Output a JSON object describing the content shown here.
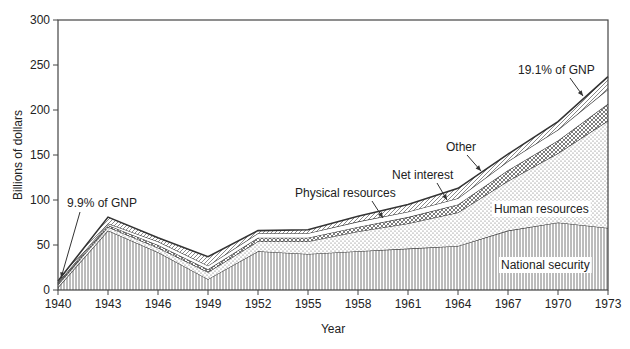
{
  "chart_data": {
    "type": "area",
    "stacked": true,
    "title": "",
    "xlabel": "Year",
    "ylabel": "Billions of dollars",
    "ylim": [
      0,
      300
    ],
    "yticks": [
      0,
      50,
      100,
      150,
      200,
      250,
      300
    ],
    "xticks": [
      1940,
      1943,
      1946,
      1949,
      1952,
      1955,
      1958,
      1961,
      1964,
      1967,
      1970,
      1973
    ],
    "x": [
      1940,
      1943,
      1946,
      1949,
      1952,
      1955,
      1958,
      1961,
      1964,
      1967,
      1970,
      1973
    ],
    "grid": false,
    "series": [
      {
        "name": "National security",
        "pattern": "vertical-lines",
        "values": [
          3,
          66,
          42,
          12,
          43,
          40,
          43,
          46,
          49,
          66,
          75,
          69
        ]
      },
      {
        "name": "Human resources",
        "pattern": "dots",
        "values": [
          3,
          4,
          5,
          8,
          11,
          14,
          22,
          28,
          37,
          55,
          77,
          119
        ]
      },
      {
        "name": "Physical resources",
        "pattern": "crosshatch",
        "values": [
          1,
          2,
          3,
          3,
          4,
          4,
          5,
          7,
          9,
          12,
          14,
          19
        ]
      },
      {
        "name": "Net interest",
        "pattern": "white",
        "values": [
          1,
          2,
          4,
          4,
          5,
          5,
          6,
          6,
          7,
          10,
          12,
          16
        ]
      },
      {
        "name": "Other",
        "pattern": "diagonal-lines",
        "values": [
          2,
          7,
          4,
          10,
          3,
          4,
          6,
          8,
          11,
          8,
          9,
          14
        ]
      }
    ],
    "annotations": [
      {
        "text": "9.9% of GNP",
        "x": 1940,
        "y": 10
      },
      {
        "text": "19.1% of GNP",
        "x": 1973,
        "y": 237
      },
      {
        "text": "Physical resources",
        "x": 1958,
        "y": 80
      },
      {
        "text": "Net interest",
        "x": 1963,
        "y": 98
      },
      {
        "text": "Other",
        "x": 1966,
        "y": 118
      }
    ],
    "inline_labels": [
      {
        "text": "Human resources",
        "x": 1969,
        "y": 155
      },
      {
        "text": "National security",
        "x": 1969,
        "y": 20
      }
    ]
  }
}
